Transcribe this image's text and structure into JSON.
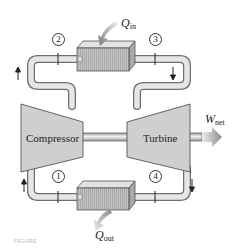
{
  "diagram": {
    "type": "gas-turbine-closed-cycle-schematic",
    "components": {
      "compressor": {
        "label": "Compressor"
      },
      "turbine": {
        "label": "Turbine"
      },
      "heat_in": {
        "symbol": "Q",
        "subscript": "in"
      },
      "heat_out": {
        "symbol": "Q",
        "subscript": "out"
      },
      "work_out": {
        "symbol": "W",
        "subscript": "net"
      }
    },
    "states": [
      "1",
      "2",
      "3",
      "4"
    ],
    "caption": "FIGURE"
  },
  "colors": {
    "pipe_fill": "#dcdcdc",
    "pipe_stroke": "#7a7a7a",
    "machine_fill": "#cfcfcf",
    "heat_exchanger_fill": "#bdbdbd",
    "arrow_fill": "#9a9a9a"
  }
}
